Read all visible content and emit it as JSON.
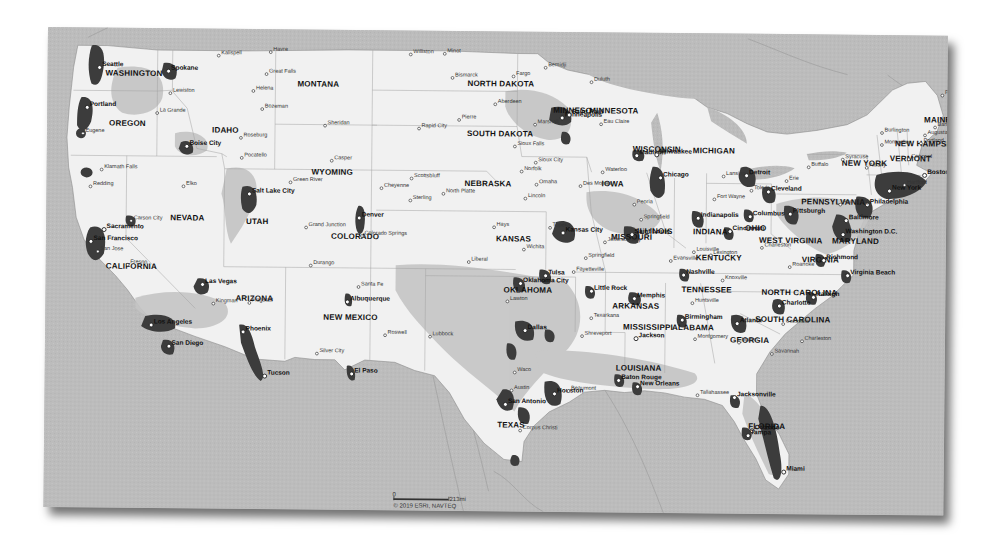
{
  "map": {
    "title": "Contiguous United States coverage map",
    "colors": {
      "water": "#bcbcbc",
      "land": "#f4f4f4",
      "land_mid": "#d6d6d6",
      "coverage_light": "#a9a9a9",
      "urban": "#3a3a3a",
      "border": "#9a9a9a",
      "shadow": "#333333"
    },
    "states": [
      {
        "name": "WASHINGTON",
        "x": 58,
        "y": 48
      },
      {
        "name": "OREGON",
        "x": 62,
        "y": 98
      },
      {
        "name": "CALIFORNIA",
        "x": 60,
        "y": 241
      },
      {
        "name": "NEVADA",
        "x": 124,
        "y": 192
      },
      {
        "name": "IDAHO",
        "x": 165,
        "y": 104
      },
      {
        "name": "MONTANA",
        "x": 250,
        "y": 57
      },
      {
        "name": "WYOMING",
        "x": 265,
        "y": 145
      },
      {
        "name": "UTAH",
        "x": 200,
        "y": 195
      },
      {
        "name": "ARIZONA",
        "x": 190,
        "y": 272
      },
      {
        "name": "COLORADO",
        "x": 285,
        "y": 209
      },
      {
        "name": "NEW MEXICO",
        "x": 278,
        "y": 290
      },
      {
        "name": "NORTH DAKOTA",
        "x": 420,
        "y": 55
      },
      {
        "name": "SOUTH DAKOTA",
        "x": 420,
        "y": 105
      },
      {
        "name": "NEBRASKA",
        "x": 418,
        "y": 155
      },
      {
        "name": "KANSAS",
        "x": 450,
        "y": 210
      },
      {
        "name": "OKLAHOMA",
        "x": 458,
        "y": 261
      },
      {
        "name": "TEXAS",
        "x": 453,
        "y": 396
      },
      {
        "name": "MINNESOTA",
        "x": 542,
        "y": 81
      },
      {
        "name": "MINNESO",
        "x": 506,
        "y": 81
      },
      {
        "name": "IOWA",
        "x": 555,
        "y": 154
      },
      {
        "name": "MISSOURI",
        "x": 565,
        "y": 207
      },
      {
        "name": "ARKANSAS",
        "x": 567,
        "y": 276
      },
      {
        "name": "LOUISIANA",
        "x": 571,
        "y": 338
      },
      {
        "name": "WISCONSIN",
        "x": 586,
        "y": 119
      },
      {
        "name": "ILLINOIS",
        "x": 591,
        "y": 201
      },
      {
        "name": "MICHIGAN",
        "x": 646,
        "y": 120
      },
      {
        "name": "INDIANA",
        "x": 647,
        "y": 201
      },
      {
        "name": "OHIO",
        "x": 699,
        "y": 197
      },
      {
        "name": "KENTUCKY",
        "x": 650,
        "y": 227
      },
      {
        "name": "TENNESSEE",
        "x": 636,
        "y": 259
      },
      {
        "name": "MISSISSIPPI",
        "x": 578,
        "y": 297
      },
      {
        "name": "ALABAMA",
        "x": 627,
        "y": 297
      },
      {
        "name": "GEORGIA",
        "x": 685,
        "y": 309
      },
      {
        "name": "FLORIDA",
        "x": 704,
        "y": 395
      },
      {
        "name": "SOUTH CAROLINA",
        "x": 710,
        "y": 288
      },
      {
        "name": "NORTH CAROLINA",
        "x": 716,
        "y": 261
      },
      {
        "name": "VIRGINIA",
        "x": 756,
        "y": 228
      },
      {
        "name": "WEST VIRGINIA",
        "x": 713,
        "y": 209
      },
      {
        "name": "MARYLAND",
        "x": 786,
        "y": 209
      },
      {
        "name": "PENNSYLVANIA",
        "x": 755,
        "y": 170
      },
      {
        "name": "NEW YORK",
        "x": 795,
        "y": 131
      },
      {
        "name": "VERMONT",
        "x": 843,
        "y": 126
      },
      {
        "name": "NEW HAMPSHIRE",
        "x": 848,
        "y": 111
      },
      {
        "name": "MAINE",
        "x": 877,
        "y": 87
      }
    ],
    "cities": [
      {
        "name": "Seattle",
        "x": 52,
        "y": 40,
        "major": true
      },
      {
        "name": "Spokane",
        "x": 121,
        "y": 43,
        "major": true
      },
      {
        "name": "Lewiston",
        "x": 123,
        "y": 65
      },
      {
        "name": "Kalispell",
        "x": 171,
        "y": 27
      },
      {
        "name": "Havre",
        "x": 223,
        "y": 23
      },
      {
        "name": "Great Falls",
        "x": 219,
        "y": 45
      },
      {
        "name": "Helena",
        "x": 206,
        "y": 62
      },
      {
        "name": "Bozeman",
        "x": 215,
        "y": 80
      },
      {
        "name": "La Grande",
        "x": 110,
        "y": 85
      },
      {
        "name": "Portland",
        "x": 40,
        "y": 80,
        "major": true
      },
      {
        "name": "Eugene",
        "x": 36,
        "y": 106
      },
      {
        "name": "Boise City",
        "x": 140,
        "y": 118,
        "major": true
      },
      {
        "name": "Roseburg",
        "x": 194,
        "y": 109
      },
      {
        "name": "Pocatello",
        "x": 195,
        "y": 129
      },
      {
        "name": "Klamath Falls",
        "x": 55,
        "y": 142
      },
      {
        "name": "Sheridan",
        "x": 278,
        "y": 96
      },
      {
        "name": "Casper",
        "x": 285,
        "y": 131
      },
      {
        "name": "Green River",
        "x": 244,
        "y": 153
      },
      {
        "name": "Redding",
        "x": 44,
        "y": 159
      },
      {
        "name": "Elko",
        "x": 137,
        "y": 158
      },
      {
        "name": "Salt Lake City",
        "x": 203,
        "y": 165,
        "major": true
      },
      {
        "name": "Carson City",
        "x": 85,
        "y": 193
      },
      {
        "name": "Sacramento",
        "x": 58,
        "y": 202,
        "major": true
      },
      {
        "name": "San Francisco",
        "x": 45,
        "y": 214,
        "major": true
      },
      {
        "name": "San Jose",
        "x": 52,
        "y": 224
      },
      {
        "name": "Fresno",
        "x": 82,
        "y": 237
      },
      {
        "name": "Las Vegas",
        "x": 157,
        "y": 256,
        "major": true
      },
      {
        "name": "Kingman",
        "x": 168,
        "y": 275
      },
      {
        "name": "Flagstaff",
        "x": 204,
        "y": 274
      },
      {
        "name": "Los Angeles",
        "x": 106,
        "y": 297,
        "major": true
      },
      {
        "name": "San Diego",
        "x": 124,
        "y": 318,
        "major": true
      },
      {
        "name": "Phoenix",
        "x": 198,
        "y": 303,
        "major": true
      },
      {
        "name": "Tucson",
        "x": 220,
        "y": 347,
        "major": true
      },
      {
        "name": "Grand Junction",
        "x": 260,
        "y": 198
      },
      {
        "name": "Durango",
        "x": 265,
        "y": 236
      },
      {
        "name": "Denver",
        "x": 313,
        "y": 188,
        "major": true
      },
      {
        "name": "Colorado Springs",
        "x": 316,
        "y": 206
      },
      {
        "name": "Santa Fe",
        "x": 313,
        "y": 257
      },
      {
        "name": "Albuquerque",
        "x": 302,
        "y": 272,
        "major": true
      },
      {
        "name": "Silver City",
        "x": 272,
        "y": 324
      },
      {
        "name": "El Paso",
        "x": 307,
        "y": 344,
        "major": true
      },
      {
        "name": "Roswell",
        "x": 340,
        "y": 305
      },
      {
        "name": "Lubbock",
        "x": 385,
        "y": 306
      },
      {
        "name": "Cheyenne",
        "x": 335,
        "y": 158
      },
      {
        "name": "Scottsbluff",
        "x": 365,
        "y": 148
      },
      {
        "name": "Sterling",
        "x": 364,
        "y": 170
      },
      {
        "name": "North Platte",
        "x": 397,
        "y": 163
      },
      {
        "name": "Williston",
        "x": 363,
        "y": 24
      },
      {
        "name": "Minot",
        "x": 397,
        "y": 23
      },
      {
        "name": "Bismarck",
        "x": 405,
        "y": 47
      },
      {
        "name": "Fargo",
        "x": 466,
        "y": 45
      },
      {
        "name": "Bemidji",
        "x": 498,
        "y": 36
      },
      {
        "name": "Duluth",
        "x": 544,
        "y": 50
      },
      {
        "name": "Aberdeen",
        "x": 448,
        "y": 73
      },
      {
        "name": "Pierre",
        "x": 412,
        "y": 89
      },
      {
        "name": "Rapid City",
        "x": 372,
        "y": 98
      },
      {
        "name": "Marshall",
        "x": 488,
        "y": 93
      },
      {
        "name": "Minneapolis",
        "x": 515,
        "y": 86,
        "major": true
      },
      {
        "name": "Saint Paul",
        "x": 522,
        "y": 83,
        "major": true
      },
      {
        "name": "Sioux Falls",
        "x": 468,
        "y": 115
      },
      {
        "name": "Eau Claire",
        "x": 554,
        "y": 92
      },
      {
        "name": "Sioux City",
        "x": 489,
        "y": 131
      },
      {
        "name": "Norfolk",
        "x": 475,
        "y": 140
      },
      {
        "name": "Omaha",
        "x": 490,
        "y": 153
      },
      {
        "name": "Lincoln",
        "x": 479,
        "y": 167
      },
      {
        "name": "Des Moines",
        "x": 534,
        "y": 154
      },
      {
        "name": "Waterloo",
        "x": 556,
        "y": 140
      },
      {
        "name": "Madison",
        "x": 590,
        "y": 123,
        "major": true
      },
      {
        "name": "Milwaukee",
        "x": 610,
        "y": 122,
        "major": true
      },
      {
        "name": "Chicago",
        "x": 614,
        "y": 145,
        "major": true
      },
      {
        "name": "Peoria",
        "x": 588,
        "y": 172
      },
      {
        "name": "Springfield",
        "x": 595,
        "y": 187
      },
      {
        "name": "Topeka",
        "x": 504,
        "y": 196
      },
      {
        "name": "Kansas City",
        "x": 517,
        "y": 201,
        "major": true
      },
      {
        "name": "Hays",
        "x": 448,
        "y": 196
      },
      {
        "name": "Wichita",
        "x": 478,
        "y": 218
      },
      {
        "name": "Liberal",
        "x": 423,
        "y": 231
      },
      {
        "name": "Saint Louis",
        "x": 586,
        "y": 202,
        "major": true
      },
      {
        "name": "Jefferson City",
        "x": 559,
        "y": 210
      },
      {
        "name": "Springfield",
        "x": 540,
        "y": 226
      },
      {
        "name": "Evansville",
        "x": 625,
        "y": 228
      },
      {
        "name": "Louisville",
        "x": 648,
        "y": 219
      },
      {
        "name": "Lexington",
        "x": 665,
        "y": 222
      },
      {
        "name": "Indianapolis",
        "x": 652,
        "y": 185,
        "major": true
      },
      {
        "name": "Fort Wayne",
        "x": 668,
        "y": 166
      },
      {
        "name": "Lansing",
        "x": 677,
        "y": 143
      },
      {
        "name": "Detroit",
        "x": 700,
        "y": 142,
        "major": true
      },
      {
        "name": "Cleveland",
        "x": 722,
        "y": 158,
        "major": true
      },
      {
        "name": "Toledo",
        "x": 705,
        "y": 157
      },
      {
        "name": "Columbus",
        "x": 704,
        "y": 183,
        "major": true
      },
      {
        "name": "Cincinnati",
        "x": 684,
        "y": 198,
        "major": true
      },
      {
        "name": "Pittsburgh",
        "x": 744,
        "y": 180,
        "major": true
      },
      {
        "name": "Erie",
        "x": 740,
        "y": 147
      },
      {
        "name": "Buffalo",
        "x": 762,
        "y": 133
      },
      {
        "name": "Syracuse",
        "x": 796,
        "y": 125
      },
      {
        "name": "Albany",
        "x": 820,
        "y": 133
      },
      {
        "name": "Burlington",
        "x": 835,
        "y": 98
      },
      {
        "name": "Montpelier",
        "x": 835,
        "y": 110
      },
      {
        "name": "Concord",
        "x": 862,
        "y": 124
      },
      {
        "name": "Portland",
        "x": 874,
        "y": 108
      },
      {
        "name": "Augusta",
        "x": 878,
        "y": 100
      },
      {
        "name": "Bangor",
        "x": 888,
        "y": 92
      },
      {
        "name": "Presque Isle",
        "x": 895,
        "y": 60
      },
      {
        "name": "Boston",
        "x": 878,
        "y": 140,
        "major": true
      },
      {
        "name": "Hartford",
        "x": 858,
        "y": 150
      },
      {
        "name": "New York",
        "x": 843,
        "y": 156,
        "major": true
      },
      {
        "name": "Philadelphia",
        "x": 821,
        "y": 170,
        "major": true
      },
      {
        "name": "Baltimore",
        "x": 800,
        "y": 186,
        "major": true
      },
      {
        "name": "Harrisburg",
        "x": 794,
        "y": 170
      },
      {
        "name": "Washington D.C.",
        "x": 797,
        "y": 200,
        "major": true
      },
      {
        "name": "Charleston",
        "x": 716,
        "y": 214
      },
      {
        "name": "Roanoke",
        "x": 744,
        "y": 233
      },
      {
        "name": "Richmond",
        "x": 778,
        "y": 226,
        "major": true
      },
      {
        "name": "Virginia Beach",
        "x": 802,
        "y": 241,
        "major": true
      },
      {
        "name": "Raleigh",
        "x": 768,
        "y": 263,
        "major": true
      },
      {
        "name": "Charlotte",
        "x": 734,
        "y": 272,
        "major": true
      },
      {
        "name": "Columbia",
        "x": 738,
        "y": 290
      },
      {
        "name": "Charleston",
        "x": 757,
        "y": 307
      },
      {
        "name": "Atlanta",
        "x": 692,
        "y": 290,
        "major": true
      },
      {
        "name": "Macon",
        "x": 694,
        "y": 309
      },
      {
        "name": "Savannah",
        "x": 727,
        "y": 320
      },
      {
        "name": "Nashville",
        "x": 638,
        "y": 242,
        "major": true
      },
      {
        "name": "Knoxville",
        "x": 677,
        "y": 247
      },
      {
        "name": "Memphis",
        "x": 589,
        "y": 266,
        "major": true
      },
      {
        "name": "Huntsville",
        "x": 647,
        "y": 270
      },
      {
        "name": "Birmingham",
        "x": 637,
        "y": 287,
        "major": true
      },
      {
        "name": "Montgomery",
        "x": 650,
        "y": 306
      },
      {
        "name": "Jackson",
        "x": 591,
        "y": 306,
        "major": true
      },
      {
        "name": "Little Rock",
        "x": 546,
        "y": 259,
        "major": true
      },
      {
        "name": "Fayetteville",
        "x": 528,
        "y": 240
      },
      {
        "name": "Tulsa",
        "x": 500,
        "y": 244,
        "major": true
      },
      {
        "name": "Oklahoma City",
        "x": 475,
        "y": 252,
        "major": true
      },
      {
        "name": "Lawton",
        "x": 462,
        "y": 270
      },
      {
        "name": "Texarkana",
        "x": 546,
        "y": 286
      },
      {
        "name": "Shreveport",
        "x": 537,
        "y": 304
      },
      {
        "name": "Dallas",
        "x": 480,
        "y": 299,
        "major": true
      },
      {
        "name": "Waco",
        "x": 470,
        "y": 341
      },
      {
        "name": "Austin",
        "x": 467,
        "y": 359
      },
      {
        "name": "San Antonio",
        "x": 461,
        "y": 373,
        "major": true
      },
      {
        "name": "Houston",
        "x": 510,
        "y": 362,
        "major": true
      },
      {
        "name": "Beaumont",
        "x": 524,
        "y": 359
      },
      {
        "name": "Corpus Christi",
        "x": 476,
        "y": 399
      },
      {
        "name": "Baton Rouge",
        "x": 574,
        "y": 348,
        "major": true
      },
      {
        "name": "New Orleans",
        "x": 593,
        "y": 354,
        "major": true
      },
      {
        "name": "Tallahassee",
        "x": 653,
        "y": 362
      },
      {
        "name": "Jacksonville",
        "x": 690,
        "y": 364,
        "major": true
      },
      {
        "name": "Orlando",
        "x": 708,
        "y": 397,
        "major": true
      },
      {
        "name": "Tampa",
        "x": 704,
        "y": 402,
        "major": true
      },
      {
        "name": "Miami",
        "x": 740,
        "y": 438,
        "major": true
      }
    ],
    "scale_bar": {
      "start_label": "0",
      "end_label": "213mi"
    },
    "copyright": "© 2019 ESRI, NAVTEQ"
  }
}
